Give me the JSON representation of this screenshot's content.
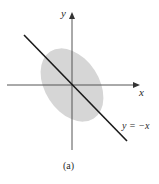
{
  "figure": {
    "caption": "(a)",
    "axes": {
      "x_label": "x",
      "y_label": "y"
    },
    "line": {
      "label": "y = −x",
      "equation": "y = -x",
      "color": "#1a1a1a"
    },
    "ellipse": {
      "description": "shaded elliptical region centered at origin, tilted along y = -x direction",
      "fill": "#d6d6d6"
    },
    "colors": {
      "axis": "#555555",
      "text": "#2a2a2a",
      "background": "#ffffff"
    }
  }
}
